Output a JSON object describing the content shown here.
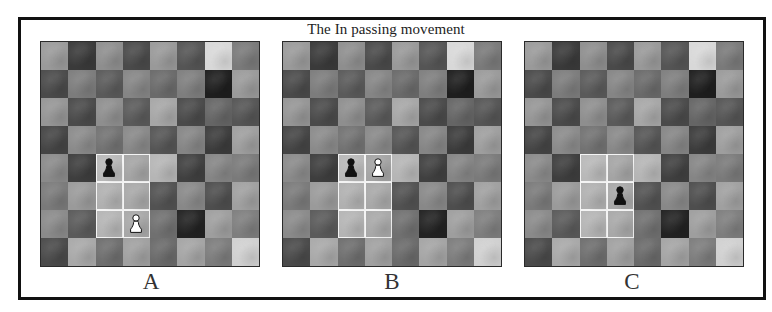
{
  "title": "The In passing movement",
  "colors": {
    "frame": "#111111",
    "highlight_border": "#f4f4f4",
    "black_pawn": "#111111",
    "white_pawn": "#ffffff"
  },
  "board_shades": [
    [
      "#9a9a9a",
      "#3a3a3a",
      "#8e8e8e",
      "#4a4a4a",
      "#999999",
      "#555555",
      "#d8d8d8",
      "#7a7a7a"
    ],
    [
      "#4a4a4a",
      "#7c7c7c",
      "#5a5a5a",
      "#858585",
      "#6a6a6a",
      "#7e7e7e",
      "#1e1e1e",
      "#9a9a9a"
    ],
    [
      "#959595",
      "#4a4a4a",
      "#8e8e8e",
      "#5a5a5a",
      "#a6a6a6",
      "#4a4a4a",
      "#656565",
      "#555555"
    ],
    [
      "#454545",
      "#8a8a8a",
      "#727272",
      "#888888",
      "#555555",
      "#858585",
      "#3c3c3c",
      "#9e9e9e"
    ],
    [
      "#8a8a8a",
      "#3e3e3e",
      "#b8b8b8",
      "#a4a4a4",
      "#b5b5b5",
      "#404040",
      "#858585",
      "#7a7a7a"
    ],
    [
      "#7a7a7a",
      "#9a9a9a",
      "#b0b0b0",
      "#a8a8a8",
      "#525252",
      "#888888",
      "#4e4e4e",
      "#a0a0a0"
    ],
    [
      "#8a8a8a",
      "#5a5a5a",
      "#b4b4b4",
      "#a8a8a8",
      "#707070",
      "#222222",
      "#9e9e9e",
      "#7e7e7e"
    ],
    [
      "#4a4a4a",
      "#a8a8a8",
      "#6e6e6e",
      "#a0a0a0",
      "#6a6a6a",
      "#a4a4a4",
      "#7c7c7c",
      "#d0d0d0"
    ]
  ],
  "highlight_squares": [
    [
      4,
      2
    ],
    [
      4,
      3
    ],
    [
      5,
      2
    ],
    [
      5,
      3
    ],
    [
      6,
      2
    ],
    [
      6,
      3
    ]
  ],
  "diagrams": [
    {
      "label": "A",
      "left": 40,
      "label_left": 131,
      "pieces": [
        {
          "type": "pawn",
          "color": "black",
          "row": 4,
          "col": 2
        },
        {
          "type": "pawn",
          "color": "white",
          "row": 6,
          "col": 3
        }
      ]
    },
    {
      "label": "B",
      "left": 282,
      "label_left": 372,
      "pieces": [
        {
          "type": "pawn",
          "color": "black",
          "row": 4,
          "col": 2
        },
        {
          "type": "pawn",
          "color": "white",
          "row": 4,
          "col": 3
        }
      ]
    },
    {
      "label": "C",
      "left": 524,
      "label_left": 612,
      "pieces": [
        {
          "type": "pawn",
          "color": "black",
          "row": 5,
          "col": 3
        }
      ]
    }
  ]
}
